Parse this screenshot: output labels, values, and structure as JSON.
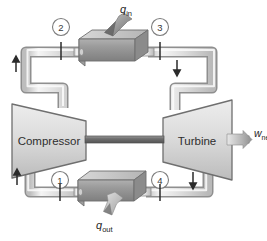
{
  "diagram": {
    "components": {
      "compressor": {
        "label": "Compressor"
      },
      "turbine": {
        "label": "Turbine"
      },
      "heater": {
        "name": "heat-addition-heat-exchanger"
      },
      "cooler": {
        "name": "heat-rejection-heat-exchanger"
      }
    },
    "flows": {
      "q_in": {
        "symbol": "q",
        "subscript": "in"
      },
      "q_out": {
        "symbol": "q",
        "subscript": "out"
      },
      "w_net": {
        "symbol": "w",
        "subscript": "net"
      }
    },
    "state_points": [
      {
        "id": "1",
        "label": "1"
      },
      {
        "id": "2",
        "label": "2"
      },
      {
        "id": "3",
        "label": "3"
      },
      {
        "id": "4",
        "label": "4"
      }
    ],
    "colors": {
      "pipe_fill": "#e4e4e4",
      "pipe_stroke": "#8a8a8a",
      "device_fill": "#d5d5d5",
      "device_stroke": "#6f6f6f",
      "exchanger_dark": "#8f8f8f",
      "exchanger_top": "#c9c9c9",
      "arrow": "#2b2b2b",
      "text": "#333333",
      "background": "#ffffff"
    }
  }
}
